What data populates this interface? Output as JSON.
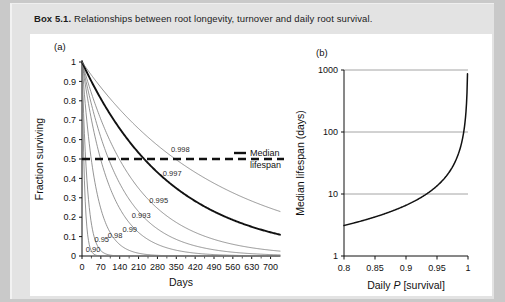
{
  "caption": {
    "box_label": "Box 5.1.",
    "text": "Relationships between root longevity, turnover and daily root survival."
  },
  "panel_a": {
    "tag": "(a)",
    "annotation_line1": "Median",
    "annotation_line2": "lifespan"
  },
  "panel_b": {
    "tag": "(b)"
  },
  "chart_data": [
    {
      "id": "panel-a",
      "type": "line",
      "title": "",
      "xlabel": "Days",
      "ylabel": "Fraction surviving",
      "xlim": [
        0,
        735
      ],
      "ylim": [
        0,
        1
      ],
      "xticks": [
        0,
        70,
        140,
        210,
        280,
        350,
        420,
        490,
        560,
        630,
        700
      ],
      "yticks": [
        0,
        0.1,
        0.2,
        0.3,
        0.4,
        0.5,
        0.6,
        0.7,
        0.8,
        0.9,
        1
      ],
      "ytick_labels": [
        "0",
        "0.1",
        "0.2",
        "0.3",
        "0.4",
        "0.5",
        "0.6",
        "0.7",
        "0.8",
        "0.9",
        "1"
      ],
      "grid": false,
      "legend_position": "inline-curve-labels",
      "equation": "fraction_surviving = P^days",
      "series": [
        {
          "name": "0.90",
          "p": 0.9,
          "label": "0.90",
          "color": "#7a7a7a",
          "width": 0.8,
          "label_x": 14,
          "label_y": 0.02
        },
        {
          "name": "0.95",
          "p": 0.95,
          "label": "0.95",
          "color": "#7a7a7a",
          "width": 0.8,
          "label_x": 46,
          "label_y": 0.07
        },
        {
          "name": "0.98",
          "p": 0.98,
          "label": "0.98",
          "color": "#7a7a7a",
          "width": 0.8,
          "label_x": 96,
          "label_y": 0.095
        },
        {
          "name": "0.99",
          "p": 0.99,
          "label": "0.99",
          "color": "#7a7a7a",
          "width": 0.8,
          "label_x": 150,
          "label_y": 0.125
        },
        {
          "name": "0.993",
          "p": 0.993,
          "label": "0.993",
          "color": "#7a7a7a",
          "width": 0.8,
          "label_x": 185,
          "label_y": 0.195
        },
        {
          "name": "0.995",
          "p": 0.995,
          "label": "0.995",
          "color": "#7a7a7a",
          "width": 0.8,
          "label_x": 250,
          "label_y": 0.275
        },
        {
          "name": "0.997",
          "p": 0.997,
          "label": "0.997",
          "color": "#111111",
          "width": 1.9,
          "label_x": 300,
          "label_y": 0.41
        },
        {
          "name": "0.998",
          "p": 0.998,
          "label": "0.998",
          "color": "#7a7a7a",
          "width": 0.8,
          "label_x": 330,
          "label_y": 0.535
        }
      ],
      "median_line": {
        "y": 0.5,
        "style": "dashed",
        "color": "#111111",
        "label": "Median lifespan"
      }
    },
    {
      "id": "panel-b",
      "type": "line",
      "title": "",
      "xlabel": "Daily P [survival]",
      "xlabel_italic_part": "P",
      "ylabel": "Median lifespan (days)",
      "xlim": [
        0.8,
        1.0
      ],
      "ylim": [
        1,
        1000
      ],
      "yscale": "log",
      "xticks": [
        0.8,
        0.85,
        0.9,
        0.95,
        1
      ],
      "xtick_labels": [
        "0.8",
        "0.85",
        "0.9",
        "0.95",
        "1"
      ],
      "yticks": [
        1,
        10,
        100,
        1000
      ],
      "ytick_labels": [
        "1",
        "10",
        "100",
        "1000"
      ],
      "grid": true,
      "equation": "median_lifespan = ln(0.5)/ln(P)",
      "series": [
        {
          "name": "median-lifespan",
          "color": "#111111",
          "width": 1.5,
          "points_x": [
            0.8,
            0.82,
            0.84,
            0.86,
            0.88,
            0.9,
            0.92,
            0.94,
            0.95,
            0.96,
            0.97,
            0.98,
            0.99,
            0.995,
            0.998
          ],
          "points_y": [
            3.1,
            3.5,
            4.0,
            4.6,
            5.4,
            6.6,
            8.3,
            11.2,
            13.5,
            17.0,
            22.8,
            34.3,
            69.0,
            138.3,
            346.2
          ]
        }
      ]
    }
  ]
}
